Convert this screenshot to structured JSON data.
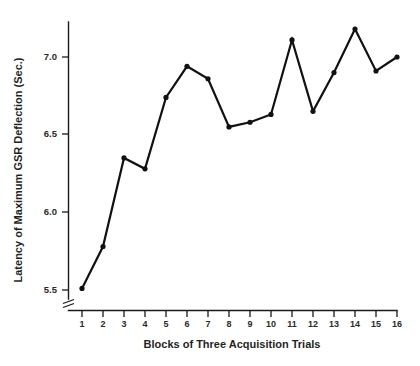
{
  "chart_data": {
    "type": "line",
    "title": "",
    "xlabel": "Blocks of Three Acquisition Trials",
    "ylabel": "Latency of Maximum GSR Deflection (Sec.)",
    "categories": [
      "1",
      "2",
      "3",
      "4",
      "5",
      "6",
      "7",
      "8",
      "9",
      "10",
      "11",
      "12",
      "13",
      "14",
      "15",
      "16"
    ],
    "x": [
      1,
      2,
      3,
      4,
      5,
      6,
      7,
      8,
      9,
      10,
      11,
      12,
      13,
      14,
      15,
      16
    ],
    "values": [
      5.51,
      5.78,
      6.35,
      6.28,
      6.74,
      6.94,
      6.86,
      6.55,
      6.58,
      6.63,
      7.11,
      6.65,
      6.9,
      7.18,
      6.91,
      7.0
    ],
    "series": [
      {
        "name": "Latency of Maximum GSR Deflection",
        "values": [
          5.51,
          5.78,
          6.35,
          6.28,
          6.74,
          6.94,
          6.86,
          6.55,
          6.58,
          6.63,
          7.11,
          6.65,
          6.9,
          7.18,
          6.91,
          7.0
        ]
      }
    ],
    "ytick_labels": [
      "7.0",
      "6.5",
      "6.0",
      "5.5"
    ],
    "ytick_values": [
      7.0,
      6.5,
      6.0,
      5.5
    ],
    "ylim": [
      5.5,
      7.25
    ],
    "xlim": [
      1,
      16
    ],
    "grid": false,
    "legend": false,
    "legend_position": "none",
    "axis_break": true,
    "axis_break_note": "y-axis broken below 5.5",
    "line_color": "#111111",
    "marker_color": "#111111",
    "marker_shape": "circle",
    "background_color": "#ffffff"
  }
}
